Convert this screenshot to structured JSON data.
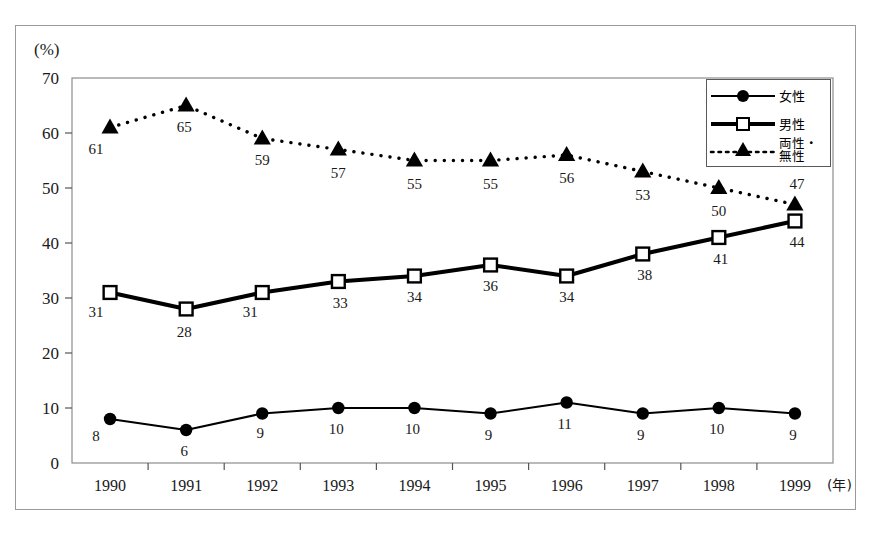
{
  "chart_data": {
    "type": "line",
    "title": "",
    "xlabel": "(年)",
    "ylabel": "(%)",
    "ylim": [
      0,
      70
    ],
    "yticks": [
      0,
      10,
      20,
      30,
      40,
      50,
      60,
      70
    ],
    "categories": [
      "1990",
      "1991",
      "1992",
      "1993",
      "1994",
      "1995",
      "1996",
      "1997",
      "1998",
      "1999"
    ],
    "grid": false,
    "legend_position": "top-right",
    "series": [
      {
        "name": "女性",
        "marker": "filled-circle",
        "line_style": "solid",
        "line_width": 2,
        "color": "#000000",
        "values": [
          8,
          6,
          9,
          10,
          10,
          9,
          11,
          9,
          10,
          9
        ],
        "labels": [
          "8",
          "6",
          "9",
          "10",
          "10",
          "9",
          "11",
          "9",
          "10",
          "9"
        ]
      },
      {
        "name": "男性",
        "marker": "open-square",
        "line_style": "solid",
        "line_width": 4,
        "color": "#000000",
        "values": [
          31,
          28,
          31,
          33,
          34,
          36,
          34,
          38,
          41,
          44
        ],
        "labels": [
          "31",
          "28",
          "31",
          "33",
          "34",
          "36",
          "34",
          "38",
          "41",
          "44"
        ]
      },
      {
        "name": "両性・無性",
        "marker": "filled-triangle",
        "line_style": "dotted",
        "line_width": 2,
        "color": "#000000",
        "values": [
          61,
          65,
          59,
          57,
          55,
          55,
          56,
          53,
          50,
          47
        ],
        "labels": [
          "61",
          "65",
          "59",
          "57",
          "55",
          "55",
          "56",
          "53",
          "50",
          "47"
        ]
      }
    ]
  },
  "legend": {
    "items": [
      {
        "label": "女性",
        "marker": "filled-circle",
        "style": "solid-thin"
      },
      {
        "label": "男性",
        "marker": "open-square",
        "style": "solid-thick"
      },
      {
        "label": "両性・\n無性",
        "marker": "filled-triangle",
        "style": "dotted"
      }
    ]
  },
  "axes": {
    "y_unit": "(%)",
    "x_unit": "(年)"
  },
  "caption": ""
}
